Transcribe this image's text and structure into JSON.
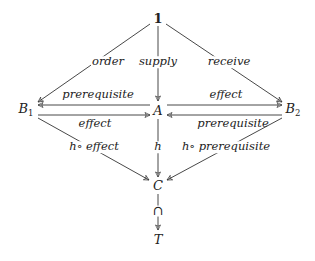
{
  "nodes": {
    "one": "1",
    "A": "A",
    "B1": {
      "base": "B",
      "sub": "1"
    },
    "B2": {
      "base": "B",
      "sub": "2"
    },
    "C": "C",
    "T": "T",
    "inclusion": "⊂"
  },
  "edge_labels": {
    "one_to_B1": "order",
    "one_to_A": "supply",
    "one_to_B2": "receive",
    "A_to_B1": "prerequisite",
    "B1_to_A": "effect",
    "A_to_B2": "effect",
    "B2_to_A": "prerequisite",
    "B1_to_C": "h∘ effect",
    "A_to_C": "h",
    "B2_to_C": "h∘ prerequisite"
  },
  "colors": {
    "stroke": "#333333",
    "text": "#222222",
    "background": "#ffffff"
  }
}
